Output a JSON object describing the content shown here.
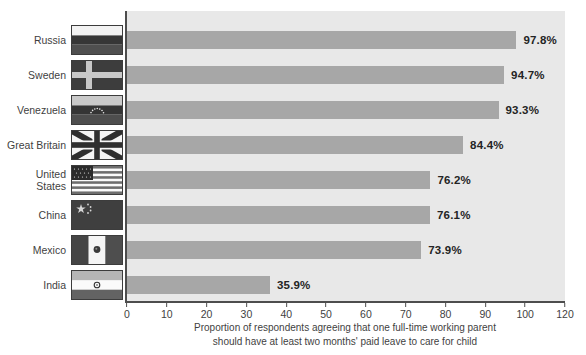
{
  "chart_data": {
    "type": "bar",
    "orientation": "horizontal",
    "title": "",
    "categories": [
      "Russia",
      "Sweden",
      "Venezuela",
      "Great Britain",
      "United\nStates",
      "China",
      "Mexico",
      "India"
    ],
    "values": [
      97.8,
      94.7,
      93.3,
      84.4,
      76.2,
      76.1,
      73.9,
      35.9
    ],
    "value_labels": [
      "97.8%",
      "94.7%",
      "93.3%",
      "84.4%",
      "76.2%",
      "76.1%",
      "73.9%",
      "35.9%"
    ],
    "flags": [
      "russia-flag",
      "sweden-flag",
      "venezuela-flag",
      "great-britain-flag",
      "united-states-flag",
      "china-flag",
      "mexico-flag",
      "india-flag"
    ],
    "x_ticks": [
      {
        "value": 0,
        "label": "0"
      },
      {
        "value": 10,
        "label": "10"
      },
      {
        "value": 20,
        "label": "20"
      },
      {
        "value": 30,
        "label": "30"
      },
      {
        "value": 40,
        "label": "40"
      },
      {
        "value": 50,
        "label": "50"
      },
      {
        "value": 60,
        "label": "60"
      },
      {
        "value": 70,
        "label": "70"
      },
      {
        "value": 80,
        "label": "80"
      },
      {
        "value": 90,
        "label": "90"
      },
      {
        "value": 100,
        "label": "100"
      },
      {
        "value": 110,
        "label": "120"
      }
    ],
    "axis_display_max": 110,
    "xlabel_lines": [
      "Proportion of respondents agreeing that one full-time working parent",
      "should have at least two months' paid leave to care for child"
    ],
    "grid": false,
    "legend": false,
    "bar_height_px": 18,
    "row_pitch_px": 35,
    "colors": {
      "bar": "#a7a7a7",
      "plot_bg": "#e8e8e8",
      "axis": "#4d4d4d",
      "value_label": "#242424",
      "tick_label": "#3f3f3f",
      "category_label": "#3f3f3f",
      "caption": "#3f3f3f",
      "page_bg": "#ffffff"
    }
  }
}
